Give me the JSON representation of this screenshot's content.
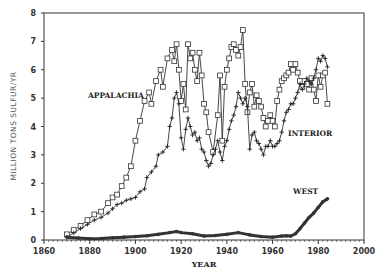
{
  "chart_data": {
    "type": "line",
    "title": "",
    "xlabel": "YEAR",
    "ylabel": "MILLION TONS SULFUR/YR",
    "xlim": [
      1860,
      2000
    ],
    "ylim": [
      0,
      8
    ],
    "x_ticks": [
      1860,
      1880,
      1900,
      1920,
      1940,
      1960,
      1980,
      2000
    ],
    "y_ticks": [
      0,
      1,
      2,
      3,
      4,
      5,
      6,
      7,
      8
    ],
    "grid": false,
    "legend": "inline labels",
    "series": [
      {
        "name": "APPALACHIA",
        "marker": "square",
        "label_pos": [
          1880,
          5.1
        ],
        "x": [
          1870,
          1873,
          1876,
          1879,
          1882,
          1885,
          1888,
          1890,
          1892,
          1894,
          1896,
          1898,
          1900,
          1902,
          1904,
          1906,
          1907,
          1909,
          1911,
          1912,
          1914,
          1916,
          1917,
          1918,
          1919,
          1920,
          1921,
          1922,
          1923,
          1924,
          1925,
          1926,
          1927,
          1928,
          1929,
          1930,
          1931,
          1932,
          1934,
          1936,
          1937,
          1938,
          1939,
          1940,
          1941,
          1942,
          1943,
          1944,
          1945,
          1946,
          1947,
          1948,
          1949,
          1950,
          1951,
          1952,
          1953,
          1954,
          1955,
          1956,
          1957,
          1958,
          1959,
          1960,
          1961,
          1962,
          1963,
          1964,
          1965,
          1966,
          1967,
          1968,
          1969,
          1970,
          1971,
          1972,
          1973,
          1974,
          1975,
          1976,
          1977,
          1978,
          1979,
          1980,
          1981,
          1982,
          1983,
          1984
        ],
        "values": [
          0.2,
          0.35,
          0.5,
          0.7,
          0.9,
          1.0,
          1.3,
          1.5,
          1.6,
          1.9,
          2.2,
          2.6,
          3.5,
          4.2,
          4.9,
          5.2,
          4.8,
          5.6,
          6.0,
          5.4,
          6.4,
          6.7,
          6.3,
          6.9,
          6.0,
          4.9,
          5.5,
          4.6,
          6.9,
          6.4,
          6.6,
          6.0,
          5.6,
          6.6,
          5.8,
          4.8,
          4.5,
          3.8,
          3.1,
          4.4,
          5.8,
          3.5,
          5.4,
          6.0,
          6.4,
          6.8,
          6.9,
          6.7,
          6.5,
          6.8,
          7.4,
          5.5,
          4.5,
          5.2,
          5.5,
          4.7,
          5.1,
          4.9,
          4.7,
          4.3,
          4.0,
          4.2,
          4.4,
          4.2,
          4.0,
          4.9,
          5.3,
          5.6,
          5.7,
          5.8,
          5.9,
          6.2,
          6.0,
          6.2,
          5.9,
          5.6,
          5.4,
          5.6,
          5.5,
          5.3,
          5.7,
          5.3,
          4.9,
          5.8,
          5.4,
          5.8,
          5.9,
          4.8
        ]
      },
      {
        "name": "INTERIOR",
        "marker": "plus",
        "label_pos": [
          1967,
          3.8
        ],
        "x": [
          1870,
          1873,
          1876,
          1879,
          1882,
          1885,
          1888,
          1890,
          1892,
          1894,
          1896,
          1898,
          1900,
          1902,
          1904,
          1905,
          1907,
          1909,
          1910,
          1912,
          1914,
          1915,
          1916,
          1917,
          1918,
          1919,
          1920,
          1921,
          1922,
          1923,
          1924,
          1925,
          1926,
          1927,
          1928,
          1929,
          1930,
          1931,
          1932,
          1933,
          1934,
          1935,
          1936,
          1937,
          1938,
          1939,
          1940,
          1941,
          1942,
          1943,
          1944,
          1945,
          1946,
          1947,
          1948,
          1949,
          1950,
          1951,
          1952,
          1953,
          1954,
          1955,
          1956,
          1957,
          1958,
          1959,
          1960,
          1961,
          1962,
          1963,
          1964,
          1965,
          1966,
          1967,
          1968,
          1969,
          1970,
          1971,
          1972,
          1973,
          1974,
          1975,
          1976,
          1977,
          1978,
          1979,
          1980,
          1981,
          1982,
          1983,
          1984
        ],
        "values": [
          0.1,
          0.25,
          0.4,
          0.55,
          0.7,
          0.8,
          0.95,
          1.1,
          1.25,
          1.3,
          1.4,
          1.45,
          1.5,
          1.7,
          1.8,
          2.2,
          2.4,
          2.6,
          3.0,
          3.1,
          3.3,
          4.0,
          4.3,
          5.0,
          5.2,
          4.8,
          3.6,
          3.2,
          3.9,
          4.3,
          4.0,
          3.7,
          3.8,
          3.5,
          3.6,
          3.2,
          3.1,
          2.8,
          2.6,
          2.7,
          3.0,
          3.2,
          3.5,
          3.1,
          2.8,
          3.3,
          3.5,
          3.9,
          4.2,
          4.4,
          4.7,
          5.2,
          5.0,
          4.8,
          5.0,
          4.7,
          3.2,
          3.7,
          3.8,
          3.5,
          3.4,
          3.2,
          3.0,
          3.3,
          3.3,
          3.5,
          3.3,
          3.3,
          3.4,
          3.5,
          3.8,
          4.2,
          4.5,
          4.6,
          4.8,
          4.8,
          5.0,
          5.2,
          5.5,
          5.3,
          5.5,
          5.7,
          5.6,
          5.5,
          5.7,
          6.0,
          6.4,
          6.3,
          6.5,
          6.4,
          6.1
        ]
      },
      {
        "name": "WEST",
        "marker": "dot",
        "label_pos": [
          1963,
          1.65
        ],
        "x": [
          1870,
          1875,
          1880,
          1885,
          1890,
          1895,
          1900,
          1905,
          1910,
          1915,
          1918,
          1920,
          1925,
          1930,
          1935,
          1940,
          1945,
          1950,
          1955,
          1960,
          1964,
          1966,
          1968,
          1970,
          1972,
          1974,
          1976,
          1978,
          1980,
          1982,
          1984
        ],
        "values": [
          0.1,
          0.07,
          0.04,
          0.05,
          0.08,
          0.1,
          0.12,
          0.15,
          0.2,
          0.26,
          0.3,
          0.26,
          0.22,
          0.14,
          0.16,
          0.2,
          0.26,
          0.18,
          0.12,
          0.1,
          0.14,
          0.15,
          0.14,
          0.22,
          0.4,
          0.6,
          0.8,
          0.95,
          1.15,
          1.35,
          1.45
        ]
      }
    ]
  },
  "labels": {
    "ylabel": "MILLION TONS SULFUR/YR",
    "xlabel": "YEAR",
    "appalachia": "APPALACHIA",
    "interior": "INTERIOR",
    "west": "WEST"
  }
}
